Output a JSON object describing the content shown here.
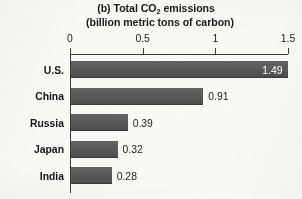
{
  "figure": {
    "panel_label": "(b)",
    "title_main": "Total CO",
    "title_sub": "2",
    "title_tail": " emissions",
    "subtitle": "(billion metric tons of carbon)"
  },
  "chart_data": {
    "type": "bar",
    "orientation": "horizontal",
    "subtitle": "(billion metric tons of carbon)",
    "xlabel": "",
    "ylabel": "",
    "xlim": [
      0,
      1.5
    ],
    "grid": false,
    "legend": "none",
    "axis_position": "top",
    "tick_labels": [
      "0",
      "0.5",
      "1",
      "1.5"
    ],
    "tick_values": [
      0,
      0.5,
      1,
      1.5
    ],
    "categories": [
      "U.S.",
      "China",
      "Russia",
      "Japan",
      "India"
    ],
    "values": [
      1.49,
      0.91,
      0.39,
      0.32,
      0.28
    ],
    "data_labels": [
      "1.49",
      "0.91",
      "0.39",
      "0.32",
      "0.28"
    ],
    "label_placement": [
      "inside",
      "outside",
      "outside",
      "outside",
      "outside"
    ],
    "bar_color": "#585858",
    "inside_label_color": "#ffffff",
    "outside_label_color": "#1b1b1b"
  }
}
